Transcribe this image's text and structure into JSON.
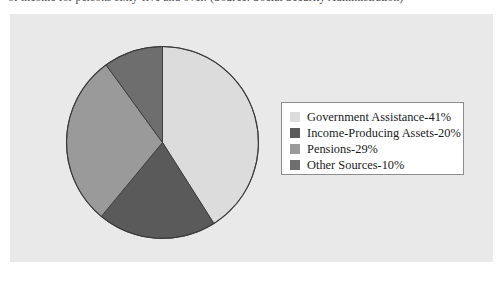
{
  "page": {
    "cropped_top_line": "of income for persons sixty-five and over. (Source: Social Security Administration)"
  },
  "chart_data": {
    "type": "pie",
    "title": "",
    "categories": [
      "Government Assistance",
      "Income-Producing Assets",
      "Pensions",
      "Other Sources"
    ],
    "values": [
      41,
      20,
      29,
      10
    ],
    "value_unit": "%",
    "colors": [
      "#dcdcdc",
      "#5a5a5a",
      "#9a9a9a",
      "#6e6e6e"
    ],
    "start_angle_deg": 0,
    "direction": "clockwise",
    "legend_position": "right",
    "grid": false,
    "slice_outline_color": "#3a3a3a",
    "panel_background": "#e9e9e9"
  },
  "legend": {
    "items": [
      {
        "label": "Government Assistance-41%",
        "swatch_name": "legend-swatch-government-assistance",
        "color": "#dcdcdc"
      },
      {
        "label": "Income-Producing Assets-20%",
        "swatch_name": "legend-swatch-income-producing-assets",
        "color": "#5a5a5a"
      },
      {
        "label": "Pensions-29%",
        "swatch_name": "legend-swatch-pensions",
        "color": "#9a9a9a"
      },
      {
        "label": "Other Sources-10%",
        "swatch_name": "legend-swatch-other-sources",
        "color": "#6e6e6e"
      }
    ]
  }
}
